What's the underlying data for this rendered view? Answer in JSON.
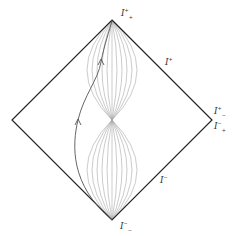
{
  "diagram": {
    "type": "penrose-diagram",
    "colors": {
      "boundary": "#222222",
      "light_cones": "#9a9a9a",
      "worldline": "#555555",
      "background": "#ffffff"
    },
    "vertices": {
      "top": [
        112,
        20
      ],
      "bottom": [
        112,
        220
      ],
      "left": [
        12,
        120
      ],
      "right": [
        212,
        120
      ],
      "center": [
        112,
        120
      ]
    },
    "labels": {
      "future_timelike_infinity": {
        "base": "I",
        "sup": "+",
        "sub": "+",
        "x": 121,
        "y": 10
      },
      "future_null_infinity": {
        "base": "I",
        "sup": "+",
        "x": 165,
        "y": 58
      },
      "spatial_infinity_upper": {
        "base": "I",
        "sup": "+",
        "sub": "−",
        "x": 214,
        "y": 108
      },
      "spatial_infinity_lower": {
        "base": "I",
        "sup": "−",
        "sub": "+",
        "x": 214,
        "y": 122
      },
      "past_null_infinity": {
        "base": "I",
        "sup": "−",
        "x": 160,
        "y": 176
      },
      "past_timelike_infinity": {
        "base": "I",
        "sup": "−",
        "sub": "−",
        "x": 120,
        "y": 222
      }
    },
    "worldline": {
      "arrows": [
        [
          78,
          122
        ],
        [
          101,
          62
        ]
      ]
    }
  }
}
